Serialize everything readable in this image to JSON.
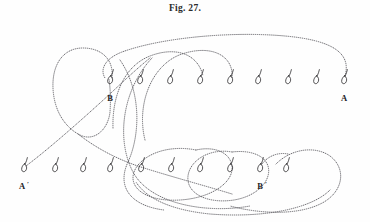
{
  "figure": {
    "caption": "Fig. 27.",
    "width": 370,
    "height": 222,
    "background_color": "#fefefe",
    "ink_color": "#55545a",
    "glyph_color": "#2e2d30",
    "style": "dotted-thread-diagram"
  },
  "labels": [
    {
      "id": "label-A",
      "text": "A",
      "prime": "",
      "x": 344,
      "y": 101
    },
    {
      "id": "label-B",
      "text": "B",
      "prime": "",
      "x": 110,
      "y": 101
    },
    {
      "id": "label-A-prime",
      "text": "A",
      "prime": "′",
      "x": 22,
      "y": 189
    },
    {
      "id": "label-B-prime",
      "text": "B",
      "prime": "′",
      "x": 260,
      "y": 189
    }
  ],
  "pins": {
    "top_row": {
      "name": "top-pin-row",
      "y": 82,
      "count": 9,
      "x_positions": [
        110,
        140,
        170,
        200,
        230,
        258,
        288,
        316,
        344
      ]
    },
    "bottom_row": {
      "name": "bottom-pin-row",
      "y": 170,
      "count": 10,
      "x_positions": [
        24,
        55,
        83,
        110,
        141,
        171,
        200,
        230,
        260,
        286
      ]
    }
  },
  "threads": [
    {
      "id": "outer-long-arc",
      "description": "long dotted arc from pin A over the top to the left side",
      "d": "M 345 76 C 352 52 330 40 285 36 C 230 31 160 38 122 52 C 104 59 100 70 105 78"
    },
    {
      "id": "left-teardrop-loop",
      "description": "closed teardrop loop at upper-left spanning B",
      "d": "M 112 78 C 114 58 100 48 83 48 C 62 48 52 66 53 88 C 54 112 66 128 80 135 C 94 142 108 130 110 112 C 111 98 110 86 109 79"
    },
    {
      "id": "long-diagonal-A-prime",
      "description": "straight dotted diagonal from A prime up to the right past B",
      "d": "M 26 166 C 50 148 86 116 112 92 C 128 77 140 66 150 58"
    },
    {
      "id": "second-arch",
      "description": "second arch from the left rising over pins to the right",
      "d": "M 113 128 C 112 96 124 66 150 56 C 176 46 198 54 203 76"
    },
    {
      "id": "third-arch",
      "description": "third arch topping out near the middle of the top row",
      "d": "M 145 140 C 136 104 152 64 182 54 C 212 44 234 56 232 78"
    },
    {
      "id": "big-left-sweep",
      "description": "large sweeping curve descending from top-left area to bottom",
      "d": "M 120 60 C 142 92 140 136 128 162 C 116 188 132 206 164 210"
    },
    {
      "id": "c-shaped-major",
      "description": "large C shaped thread enclosing the central region",
      "d": "M 152 58 C 122 90 116 140 133 172 C 150 204 206 214 250 206"
    },
    {
      "id": "lower-left-hook",
      "description": "curve from loop bottom sweeping down-left to bottom row",
      "d": "M 78 134 C 96 148 118 160 144 168 C 176 178 206 186 232 194"
    },
    {
      "id": "lower-inner-loop-1",
      "description": "inner elongated loop around middle bottom pins",
      "d": "M 196 150 C 166 144 140 156 134 172 C 128 190 150 202 180 200 C 212 198 234 182 232 166 C 230 152 214 146 196 150"
    },
    {
      "id": "lower-inner-loop-2",
      "description": "second inner loop shifted right around bottom pins",
      "d": "M 232 152 C 210 148 190 160 188 176 C 186 194 208 204 234 200 C 258 196 272 180 268 166 C 264 154 248 150 232 152"
    },
    {
      "id": "lower-right-loop",
      "description": "right hand loop beside B prime",
      "d": "M 276 164 C 292 148 316 146 330 156 C 346 168 344 190 324 202 C 300 216 260 214 230 206"
    },
    {
      "id": "bottom-long-sweep",
      "description": "long dotted sweep along the bottom connecting right loop to left",
      "d": "M 330 190 C 310 210 260 218 210 214 C 170 210 146 198 136 182"
    },
    {
      "id": "right-descender",
      "description": "short descending thread near B prime pin",
      "d": "M 262 164 C 268 156 278 152 288 154"
    }
  ]
}
